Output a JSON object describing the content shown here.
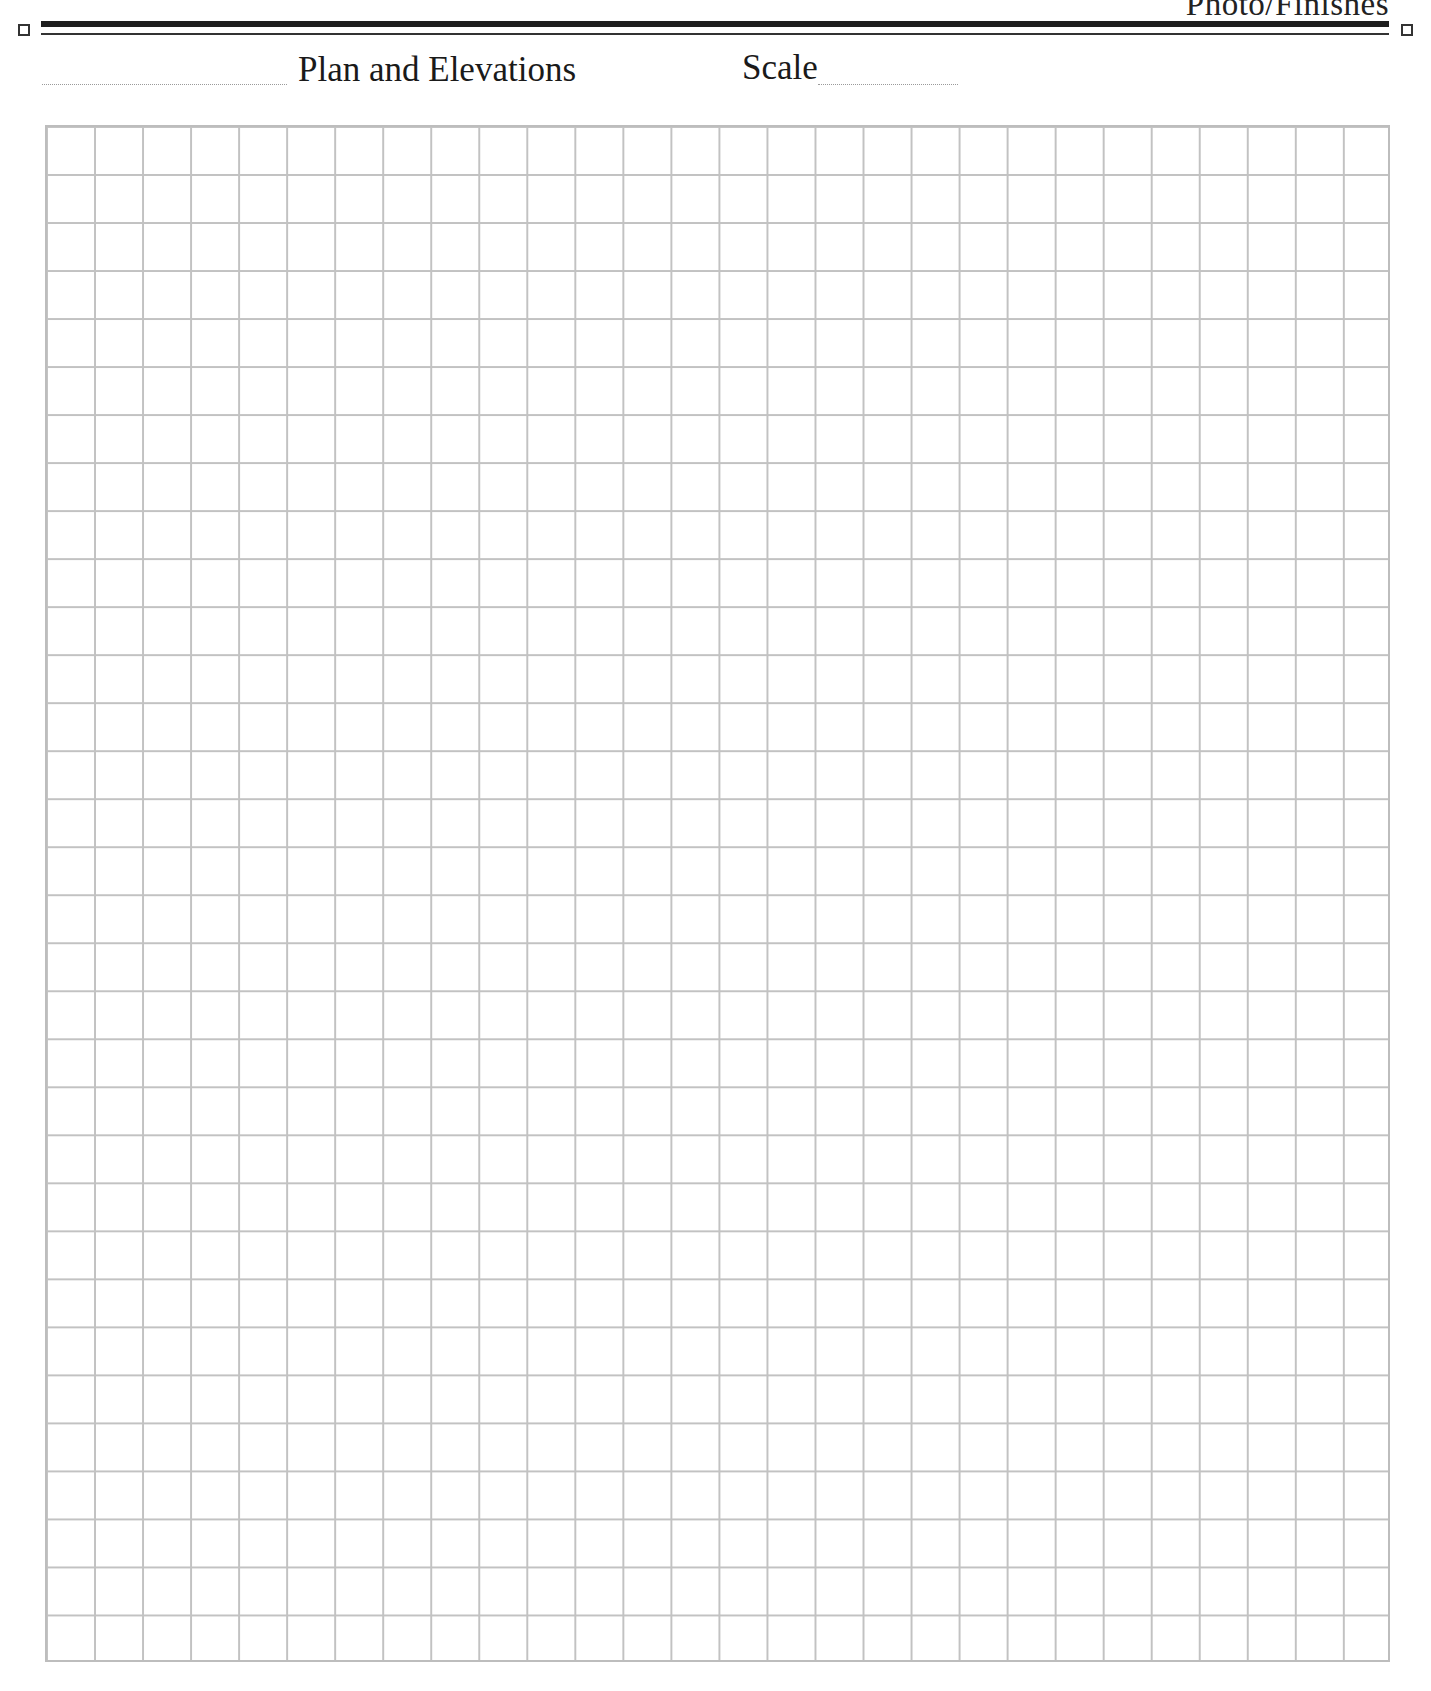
{
  "header": {
    "section_label": "Photo/Finishes",
    "title": "Plan and Elevations",
    "scale_label": "Scale",
    "scale_value": "",
    "name_field_value": ""
  },
  "grid": {
    "columns": 28,
    "rows": 32,
    "line_color": "#c2c2c2"
  },
  "colors": {
    "rule": "#1e1e1e",
    "text": "#1a1a1a",
    "background": "#ffffff"
  }
}
